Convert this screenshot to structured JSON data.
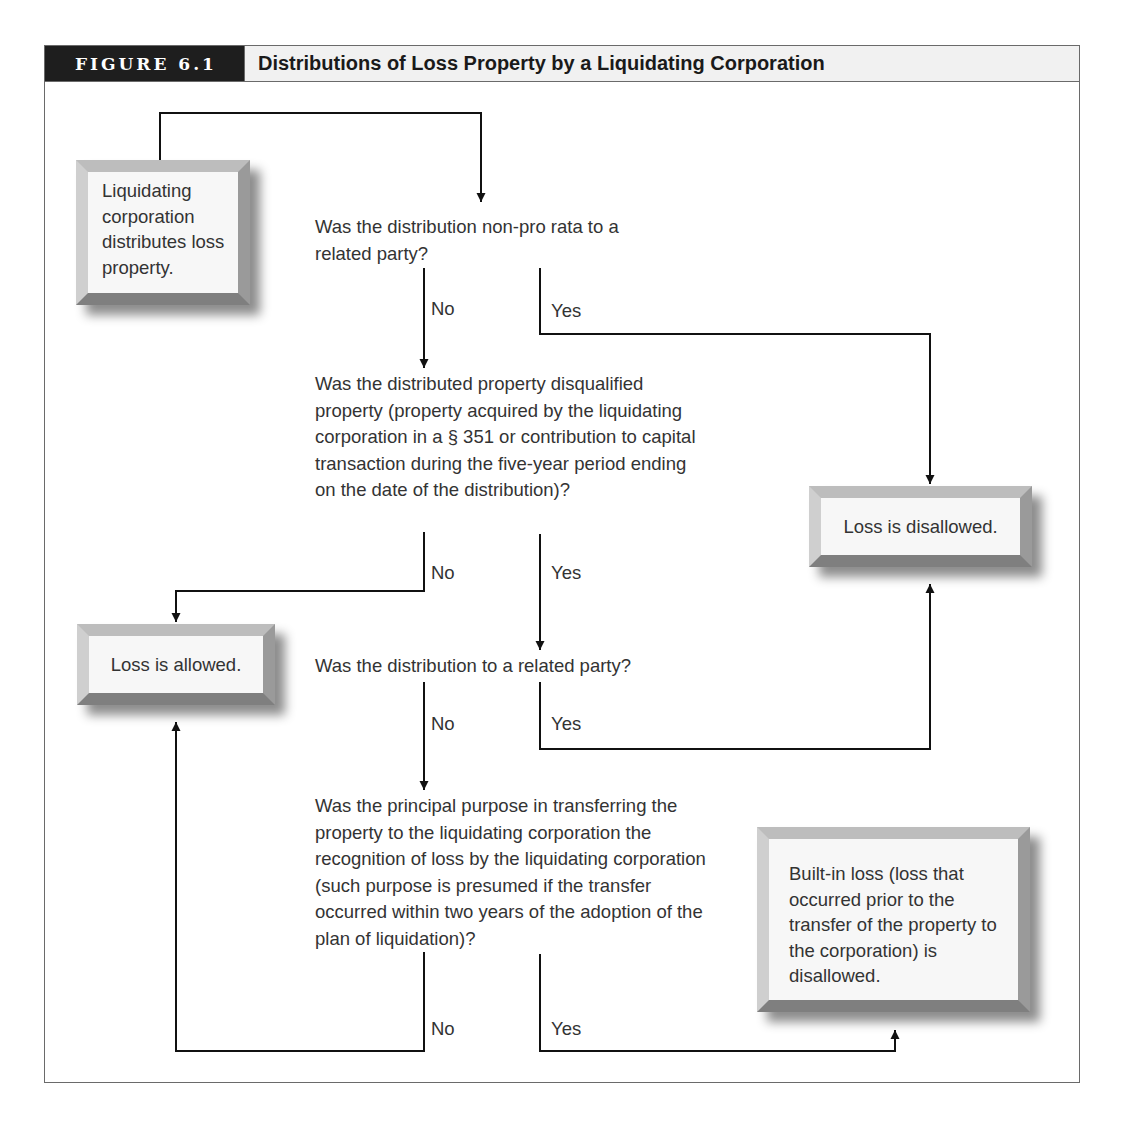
{
  "figure": {
    "label": "FIGURE 6.1",
    "title": "Distributions of Loss Property by a Liquidating Corporation"
  },
  "boxes": {
    "start": "Liquidating corporation distributes loss property.",
    "disallowed": "Loss is disallowed.",
    "allowed": "Loss is allowed.",
    "built_in": "Built-in loss (loss that occurred prior to the transfer of the property to the corporation) is disallowed."
  },
  "questions": {
    "q1": "Was the distribution non-pro rata to a related party?",
    "q2": "Was the distributed property disqualified property (property acquired by the liquidating corporation in a § 351 or contribution to capital transaction during the five-year period ending on the date of the distribution)?",
    "q3": "Was the distribution to a related party?",
    "q4": "Was the principal purpose in transferring the property to the liquidating corporation the recognition of loss by the liquidating corporation (such purpose is presumed if the transfer occurred within two years of the adoption of the plan of liquidation)?"
  },
  "branch_labels": {
    "q1_no": "No",
    "q1_yes": "Yes",
    "q2_no": "No",
    "q2_yes": "Yes",
    "q3_no": "No",
    "q3_yes": "Yes",
    "q4_no": "No",
    "q4_yes": "Yes"
  },
  "colors": {
    "header_bg": "#1e1e1e",
    "title_band": "#f1f1f1",
    "line": "#111111",
    "box_face": "#f7f7f7"
  }
}
